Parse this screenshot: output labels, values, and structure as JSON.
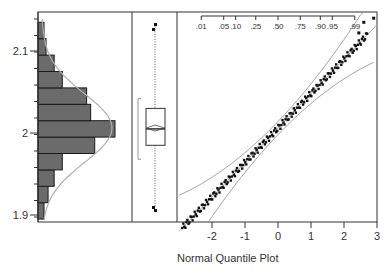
{
  "chart_data": [
    {
      "type": "bar",
      "orientation": "horizontal",
      "title": "",
      "panel": "histogram",
      "ylabel": "",
      "yticks": [
        "1.9",
        "2",
        "2.1"
      ],
      "ylim": [
        1.895,
        2.14
      ],
      "bins": [
        {
          "low": 1.895,
          "high": 1.915,
          "count": 1
        },
        {
          "low": 1.915,
          "high": 1.935,
          "count": 3
        },
        {
          "low": 1.935,
          "high": 1.955,
          "count": 6
        },
        {
          "low": 1.955,
          "high": 1.975,
          "count": 10
        },
        {
          "low": 1.975,
          "high": 1.995,
          "count": 26
        },
        {
          "low": 1.995,
          "high": 2.015,
          "count": 36
        },
        {
          "low": 2.015,
          "high": 2.035,
          "count": 24
        },
        {
          "low": 2.035,
          "high": 2.055,
          "count": 22
        },
        {
          "low": 2.055,
          "high": 2.075,
          "count": 10
        },
        {
          "low": 2.075,
          "high": 2.095,
          "count": 6
        },
        {
          "low": 2.095,
          "high": 2.115,
          "count": 2
        },
        {
          "low": 2.115,
          "high": 2.135,
          "count": 1
        }
      ],
      "overlay": "normal density curve"
    },
    {
      "type": "box",
      "panel": "outlier box plot",
      "median": 2.005,
      "mean": 2.006,
      "q1": 1.985,
      "q3": 2.03,
      "whisker_low": 1.91,
      "whisker_high": 2.13,
      "outliers": [
        1.905,
        1.9,
        2.135,
        2.14
      ],
      "shortest_half_bracket": [
        1.968,
        2.042
      ]
    },
    {
      "type": "scatter",
      "panel": "normal quantile plot",
      "title": "",
      "xlabel": "Normal Quantile Plot",
      "xticks": [
        "-2",
        "-1",
        "0",
        "1",
        "2",
        "3"
      ],
      "xlim": [
        -3.1,
        3
      ],
      "top_axis_probabilities": [
        ".01",
        ".05",
        ".10",
        ".25",
        ".50",
        ".75",
        ".90",
        ".95",
        ".99"
      ],
      "reference_line": {
        "intercept": 2.006,
        "slope": 0.042
      },
      "confidence_bands": "Lilliefors",
      "points_approx": [
        [
          -2.9,
          1.902
        ],
        [
          -2.7,
          1.908
        ],
        [
          -2.5,
          1.915
        ],
        [
          -2.3,
          1.922
        ],
        [
          -2.1,
          1.928
        ],
        [
          -1.9,
          1.934
        ],
        [
          -1.7,
          1.94
        ],
        [
          -1.5,
          1.946
        ],
        [
          -1.3,
          1.952
        ],
        [
          -1.1,
          1.958
        ],
        [
          -0.9,
          1.965
        ],
        [
          -0.7,
          1.973
        ],
        [
          -0.5,
          1.982
        ],
        [
          -0.3,
          1.992
        ],
        [
          -0.1,
          2.0
        ],
        [
          0.1,
          2.008
        ],
        [
          0.3,
          2.016
        ],
        [
          0.5,
          2.026
        ],
        [
          0.7,
          2.035
        ],
        [
          0.9,
          2.042
        ],
        [
          1.1,
          2.05
        ],
        [
          1.3,
          2.058
        ],
        [
          1.5,
          2.066
        ],
        [
          1.7,
          2.076
        ],
        [
          1.9,
          2.088
        ],
        [
          2.1,
          2.1
        ],
        [
          2.3,
          2.112
        ],
        [
          2.45,
          2.128
        ],
        [
          2.7,
          2.14
        ]
      ]
    }
  ],
  "labels": {
    "x_axis_title": "Normal Quantile Plot",
    "y_ticks": [
      "2.1",
      "2",
      "1.9"
    ],
    "x_ticks": [
      "-2",
      "-1",
      "0",
      "1",
      "2",
      "3"
    ],
    "prob_ticks": [
      ".01",
      ".05",
      ".10",
      ".25",
      ".50",
      ".75",
      ".90",
      ".95",
      ".99"
    ]
  },
  "colors": {
    "bar_fill": "#6b6b6b",
    "bar_edge": "#1a1a1a",
    "curve": "#b0b0b0",
    "frame": "#333333",
    "points": "#111111",
    "band": "#999999"
  }
}
